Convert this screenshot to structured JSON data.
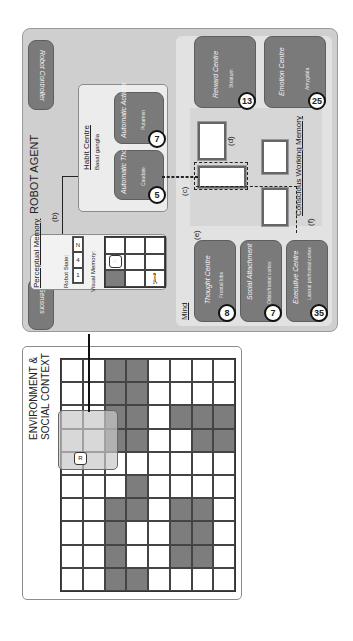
{
  "environment": {
    "title_line1": "ENVIRONMENT &",
    "title_line2": "SOCIAL CONTEXT",
    "grid_rows": 8,
    "grid_cols": 10,
    "dark_cells": [
      [
        2,
        0
      ],
      [
        3,
        0
      ],
      [
        2,
        1
      ],
      [
        3,
        1
      ],
      [
        2,
        2
      ],
      [
        3,
        2
      ],
      [
        2,
        3
      ],
      [
        3,
        3
      ],
      [
        6,
        2
      ],
      [
        7,
        2
      ],
      [
        6,
        3
      ],
      [
        7,
        3
      ],
      [
        5,
        2
      ],
      [
        3,
        5
      ],
      [
        3,
        6
      ],
      [
        2,
        6
      ],
      [
        2,
        7
      ],
      [
        2,
        8
      ],
      [
        2,
        9
      ],
      [
        3,
        9
      ],
      [
        5,
        6
      ],
      [
        6,
        6
      ],
      [
        5,
        7
      ],
      [
        6,
        7
      ],
      [
        5,
        8
      ],
      [
        6,
        8
      ]
    ],
    "cell_labels": {
      "D": "D",
      "S": "S",
      "H": "H",
      "C": "C"
    },
    "robot_marker": "R"
  },
  "agent": {
    "title": "ROBOT AGENT",
    "robot_controller": "Robot Controller",
    "sensors": "Sensors",
    "arrow_labels": {
      "a": "(a)",
      "b": "(b)",
      "c": "(c)",
      "d": "(d)",
      "e": "(e)",
      "f": "(f)"
    },
    "perceptual_memory": {
      "title": "Perceptual Memory",
      "robot_state_label": "Robot State:",
      "robot_state": [
        "1",
        "4",
        "N"
      ],
      "visual_memory_label": "Visual Memory:",
      "robot_marker": "R"
    },
    "habit_centre": {
      "title": "Habit Centre",
      "subtitle": "Basal ganglia",
      "automatic_thoughts": {
        "label": "Automatic Thoughts",
        "sub": "Caudate",
        "badge": "5"
      },
      "automatic_actions": {
        "label": "Automatic Actions",
        "sub": "Putamen",
        "badge": "7"
      }
    },
    "reward_centre": {
      "label": "Reward Centre",
      "sub": "Striatum",
      "badge": "13"
    },
    "emotion_centre": {
      "label": "Emotion Centre",
      "sub": "Amygdala",
      "badge": "25"
    },
    "mind": {
      "title": "Mind",
      "thought_centre": {
        "label": "Thought Centre",
        "sub": "Frontal lobe",
        "badge": "8"
      },
      "social_attachment": {
        "label": "Social Attachment",
        "sub": "Orbitofrontal cortex",
        "badge": "7"
      },
      "executive_centre": {
        "label": "Executive Centre",
        "sub": "Lateral prefrontal cortex",
        "badge": "35"
      }
    },
    "conscious_working_memory": {
      "title": "Conscious Working Memory",
      "card_labels": {
        "H": "H",
        "C": "C",
        "R": "R"
      }
    }
  },
  "colors": {
    "dark_box": "#7a7a7a",
    "agent_bg": "#cfcfcf",
    "panel_bg": "#e2e2e2"
  }
}
